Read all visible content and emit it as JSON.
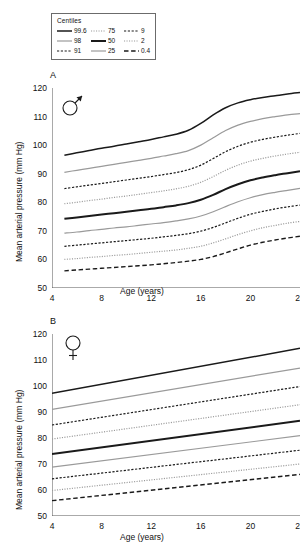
{
  "legend": {
    "title": "Centiles",
    "columns": [
      [
        {
          "label": "99.6",
          "style": "solid",
          "color": "#1a1a1a",
          "width": 1.5
        },
        {
          "label": "98",
          "style": "solid",
          "color": "#9a9a9a",
          "width": 1.2
        },
        {
          "label": "91",
          "style": "dashed",
          "color": "#1a1a1a",
          "width": 1.2
        }
      ],
      [
        {
          "label": "75",
          "style": "dotted",
          "color": "#9a9a9a",
          "width": 1.2
        },
        {
          "label": "50",
          "style": "solid",
          "color": "#1a1a1a",
          "width": 2.0
        },
        {
          "label": "25",
          "style": "solid",
          "color": "#9a9a9a",
          "width": 1.2
        }
      ],
      [
        {
          "label": "9",
          "style": "dashed",
          "color": "#1a1a1a",
          "width": 1.2
        },
        {
          "label": "2",
          "style": "dotted",
          "color": "#9a9a9a",
          "width": 1.2
        },
        {
          "label": "0.4",
          "style": "longdash",
          "color": "#1a1a1a",
          "width": 1.4
        }
      ]
    ]
  },
  "panels": [
    {
      "letter": "A",
      "symbol": "male-symbol",
      "symbol_label": "Male"
    },
    {
      "letter": "B",
      "symbol": "female-symbol",
      "symbol_label": "Female"
    }
  ],
  "chart_data": [
    {
      "type": "line",
      "panel": "A",
      "subject": "Male",
      "title": "",
      "xlabel": "Age (years)",
      "ylabel": "Mean arterial pressure (mm Hg)",
      "xlim": [
        4,
        24
      ],
      "ylim": [
        50,
        120
      ],
      "xticks": [
        4,
        8,
        12,
        16,
        20,
        24
      ],
      "yticks": [
        50,
        60,
        70,
        80,
        90,
        100,
        110,
        120
      ],
      "grid": false,
      "legend_position": "above-plot",
      "x": [
        5,
        6,
        7,
        8,
        9,
        10,
        11,
        12,
        13,
        14,
        15,
        16,
        17,
        18,
        19,
        20,
        21,
        22,
        23,
        24
      ],
      "series": [
        {
          "name": "99.6",
          "style": "solid",
          "color": "#1a1a1a",
          "width": 1.5,
          "values": [
            96.5,
            97.3,
            98.1,
            98.9,
            99.6,
            100.4,
            101.2,
            102.0,
            102.9,
            103.8,
            105.2,
            107.6,
            110.6,
            113.1,
            114.8,
            115.9,
            116.7,
            117.3,
            117.9,
            118.4
          ]
        },
        {
          "name": "98",
          "style": "solid",
          "color": "#9a9a9a",
          "width": 1.2,
          "values": [
            90.5,
            91.2,
            91.9,
            92.6,
            93.3,
            94.0,
            94.7,
            95.4,
            96.2,
            97.0,
            98.1,
            100.0,
            102.6,
            105.1,
            107.0,
            108.3,
            109.3,
            110.0,
            110.6,
            111.0
          ]
        },
        {
          "name": "91",
          "style": "dashed",
          "color": "#1a1a1a",
          "width": 1.2,
          "values": [
            84.8,
            85.4,
            86.0,
            86.6,
            87.2,
            87.8,
            88.4,
            89.0,
            89.7,
            90.4,
            91.4,
            93.0,
            95.3,
            97.7,
            99.6,
            101.0,
            102.0,
            102.8,
            103.5,
            104.1
          ]
        },
        {
          "name": "75",
          "style": "dotted",
          "color": "#9a9a9a",
          "width": 1.2,
          "values": [
            79.5,
            80.0,
            80.6,
            81.1,
            81.7,
            82.2,
            82.8,
            83.4,
            84.0,
            84.7,
            85.6,
            87.0,
            89.0,
            91.2,
            93.0,
            94.4,
            95.4,
            96.2,
            96.9,
            97.5
          ]
        },
        {
          "name": "50",
          "style": "solid",
          "color": "#1a1a1a",
          "width": 2.0,
          "values": [
            74.2,
            74.7,
            75.2,
            75.7,
            76.2,
            76.7,
            77.2,
            77.7,
            78.3,
            78.9,
            79.7,
            80.9,
            82.6,
            84.6,
            86.3,
            87.7,
            88.7,
            89.5,
            90.2,
            90.9
          ]
        },
        {
          "name": "25",
          "style": "solid",
          "color": "#9a9a9a",
          "width": 1.2,
          "values": [
            69.2,
            69.6,
            70.1,
            70.5,
            71.0,
            71.4,
            71.9,
            72.4,
            72.9,
            73.5,
            74.2,
            75.2,
            76.7,
            78.5,
            80.2,
            81.6,
            82.7,
            83.5,
            84.2,
            84.9
          ]
        },
        {
          "name": "9",
          "style": "dashed",
          "color": "#1a1a1a",
          "width": 1.2,
          "values": [
            64.6,
            65.0,
            65.4,
            65.8,
            66.2,
            66.6,
            67.0,
            67.4,
            67.9,
            68.4,
            69.0,
            69.9,
            71.2,
            72.8,
            74.4,
            75.8,
            76.8,
            77.7,
            78.4,
            79.0
          ]
        },
        {
          "name": "2",
          "style": "dotted",
          "color": "#9a9a9a",
          "width": 1.2,
          "values": [
            60.0,
            60.3,
            60.7,
            61.0,
            61.4,
            61.7,
            62.1,
            62.5,
            62.9,
            63.3,
            63.9,
            64.6,
            65.8,
            67.2,
            68.7,
            70.0,
            71.1,
            71.9,
            72.7,
            73.3
          ]
        },
        {
          "name": "0.4",
          "style": "longdash",
          "color": "#1a1a1a",
          "width": 1.4,
          "values": [
            56.0,
            56.3,
            56.6,
            56.9,
            57.2,
            57.5,
            57.8,
            58.1,
            58.5,
            58.9,
            59.4,
            60.0,
            61.0,
            62.3,
            63.7,
            65.0,
            66.0,
            66.8,
            67.5,
            68.1
          ]
        }
      ]
    },
    {
      "type": "line",
      "panel": "B",
      "subject": "Female",
      "title": "",
      "xlabel": "Age (years)",
      "ylabel": "Mean arterial pressure (mm Hg)",
      "xlim": [
        4,
        24
      ],
      "ylim": [
        50,
        120
      ],
      "xticks": [
        4,
        8,
        12,
        16,
        20,
        24
      ],
      "yticks": [
        50,
        60,
        70,
        80,
        90,
        100,
        110,
        120
      ],
      "grid": false,
      "legend_position": "above-plot",
      "x": [
        4,
        24
      ],
      "series": [
        {
          "name": "99.6",
          "style": "solid",
          "color": "#1a1a1a",
          "width": 1.5,
          "values": [
            97.2,
            114.5
          ]
        },
        {
          "name": "98",
          "style": "solid",
          "color": "#9a9a9a",
          "width": 1.2,
          "values": [
            91.0,
            106.9
          ]
        },
        {
          "name": "91",
          "style": "dashed",
          "color": "#1a1a1a",
          "width": 1.2,
          "values": [
            85.0,
            99.8
          ]
        },
        {
          "name": "75",
          "style": "dotted",
          "color": "#9a9a9a",
          "width": 1.2,
          "values": [
            79.6,
            92.8
          ]
        },
        {
          "name": "50",
          "style": "solid",
          "color": "#1a1a1a",
          "width": 2.0,
          "values": [
            73.8,
            86.6
          ]
        },
        {
          "name": "25",
          "style": "solid",
          "color": "#9a9a9a",
          "width": 1.2,
          "values": [
            68.8,
            80.9
          ]
        },
        {
          "name": "9",
          "style": "dashed",
          "color": "#1a1a1a",
          "width": 1.2,
          "values": [
            64.3,
            75.3
          ]
        },
        {
          "name": "2",
          "style": "dotted",
          "color": "#9a9a9a",
          "width": 1.2,
          "values": [
            59.8,
            70.0
          ]
        },
        {
          "name": "0.4",
          "style": "longdash",
          "color": "#1a1a1a",
          "width": 1.4,
          "values": [
            55.9,
            66.0
          ]
        }
      ]
    }
  ]
}
